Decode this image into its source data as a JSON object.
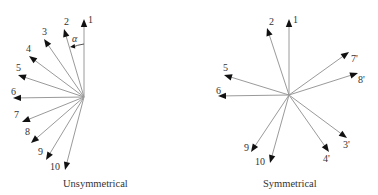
{
  "diagrams": [
    {
      "id": "unsymmetrical",
      "caption": "Unsymmetrical",
      "caption_pos": [
        63,
        187
      ],
      "center": [
        84,
        97
      ],
      "vectors": [
        {
          "label": "1",
          "tip": [
            84,
            19
          ],
          "label_pos": [
            88,
            23
          ]
        },
        {
          "label": "2",
          "tip": [
            64,
            29
          ],
          "label_pos": [
            64,
            25
          ]
        },
        {
          "label": "3",
          "tip": [
            44,
            39
          ],
          "label_pos": [
            42,
            35
          ]
        },
        {
          "label": "4",
          "tip": [
            29,
            56
          ],
          "label_pos": [
            26,
            52
          ]
        },
        {
          "label": "5",
          "tip": [
            18,
            75
          ],
          "label_pos": [
            16,
            71
          ]
        },
        {
          "label": "6",
          "tip": [
            13,
            98
          ],
          "label_pos": [
            11,
            95
          ]
        },
        {
          "label": "7",
          "tip": [
            22,
            122
          ],
          "label_pos": [
            14,
            118
          ]
        },
        {
          "label": "8",
          "tip": [
            31,
            143
          ],
          "label_pos": [
            25,
            135
          ]
        },
        {
          "label": "9",
          "tip": [
            46,
            160
          ],
          "label_pos": [
            38,
            155
          ]
        },
        {
          "label": "10",
          "tip": [
            65,
            170
          ],
          "label_pos": [
            50,
            170
          ]
        }
      ],
      "angle_annotation": {
        "label": "α",
        "label_pos": [
          72,
          42
        ],
        "arc_from": [
          84,
          44
        ],
        "arc_to": [
          70,
          47
        ]
      }
    },
    {
      "id": "symmetrical",
      "caption": "Symmetrical",
      "caption_pos": [
        263,
        187
      ],
      "center": [
        289,
        95
      ],
      "vectors": [
        {
          "label": "1",
          "tip": [
            289,
            19
          ],
          "label_pos": [
            293,
            23
          ]
        },
        {
          "label": "2",
          "tip": [
            267,
            28
          ],
          "label_pos": [
            269,
            25
          ]
        },
        {
          "label": "5",
          "tip": [
            224,
            75
          ],
          "label_pos": [
            223,
            71
          ]
        },
        {
          "label": "6",
          "tip": [
            218,
            96
          ],
          "label_pos": [
            216,
            94
          ]
        },
        {
          "label": "7'",
          "tip": [
            349,
            52
          ],
          "label_pos": [
            351,
            62
          ]
        },
        {
          "label": "8'",
          "tip": [
            358,
            73
          ],
          "label_pos": [
            358,
            83
          ]
        },
        {
          "label": "3'",
          "tip": [
            347,
            138
          ],
          "label_pos": [
            343,
            148
          ]
        },
        {
          "label": "4'",
          "tip": [
            329,
            152
          ],
          "label_pos": [
            323,
            162
          ]
        },
        {
          "label": "9",
          "tip": [
            251,
            152
          ],
          "label_pos": [
            244,
            151
          ]
        },
        {
          "label": "10",
          "tip": [
            270,
            163
          ],
          "label_pos": [
            255,
            165
          ]
        }
      ]
    }
  ],
  "colors": {
    "ray": "#9a9a9a",
    "arrowhead": "#111111",
    "text": "#333333"
  }
}
